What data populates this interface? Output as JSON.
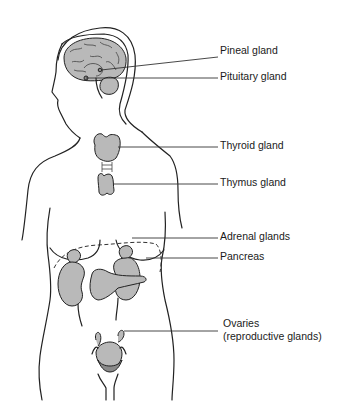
{
  "diagram": {
    "type": "anatomical-illustration",
    "colors": {
      "background": "#ffffff",
      "outline": "#222222",
      "organ_fill": "#b9b9b9",
      "label_text": "#1a1a1a"
    },
    "labels": [
      {
        "id": "pineal",
        "text": "Pineal gland"
      },
      {
        "id": "pituitary",
        "text": "Pituitary gland"
      },
      {
        "id": "thyroid",
        "text": "Thyroid gland"
      },
      {
        "id": "thymus",
        "text": "Thymus gland"
      },
      {
        "id": "adrenal",
        "text": "Adrenal glands"
      },
      {
        "id": "pancreas",
        "text": "Pancreas"
      },
      {
        "id": "ovaries",
        "text": "Ovaries",
        "subtext": "(reproductive glands)"
      }
    ]
  }
}
